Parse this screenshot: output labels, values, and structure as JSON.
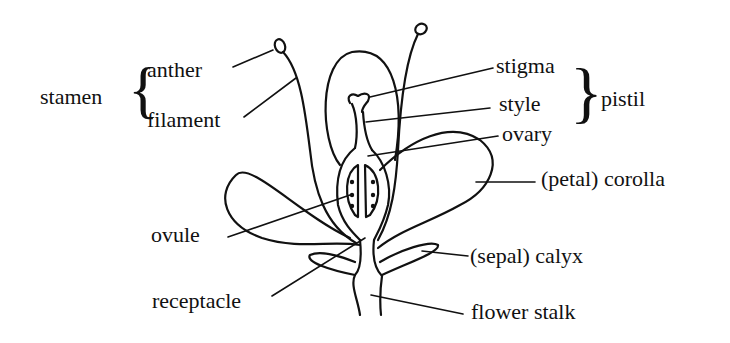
{
  "diagram": {
    "groups": {
      "stamen": "stamen",
      "pistil": "pistil"
    },
    "labels": {
      "anther": "anther",
      "filament": "filament",
      "stigma": "stigma",
      "style": "style",
      "ovary": "ovary",
      "corolla": "(petal) corolla",
      "ovule": "ovule",
      "calyx": "(sepal) calyx",
      "receptacle": "receptacle",
      "flower_stalk": "flower stalk"
    },
    "brace_glyphs": {
      "left": "{",
      "right": "}"
    },
    "colors": {
      "ink": "#111111",
      "background": "#ffffff"
    }
  }
}
